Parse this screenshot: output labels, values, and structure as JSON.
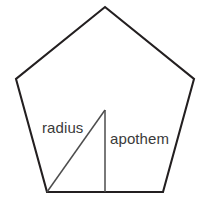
{
  "diagram": {
    "type": "geometry-figure",
    "shape_name": "regular-pentagon",
    "background_color": "#ffffff",
    "outline_color": "#231f20",
    "measure_line_color": "#4d4d4d",
    "label_color": "#3a3a3a",
    "canvas": {
      "width": 208,
      "height": 208
    },
    "pentagon": {
      "points": "105,7 194,79 163,192 47,192 16,79",
      "vertices": [
        {
          "name": "apex-top",
          "x": 105,
          "y": 7
        },
        {
          "name": "vertex-right",
          "x": 194,
          "y": 79
        },
        {
          "name": "vertex-bottom-right",
          "x": 163,
          "y": 192
        },
        {
          "name": "vertex-bottom-left",
          "x": 47,
          "y": 192
        },
        {
          "name": "vertex-left",
          "x": 16,
          "y": 79
        }
      ],
      "center": {
        "x": 105,
        "y": 110
      }
    },
    "radius_segment": {
      "label": "radius",
      "x1": 105,
      "y1": 110,
      "x2": 47,
      "y2": 192
    },
    "apothem_segment": {
      "label": "apothem",
      "x1": 105,
      "y1": 110,
      "x2": 105,
      "y2": 192
    }
  }
}
